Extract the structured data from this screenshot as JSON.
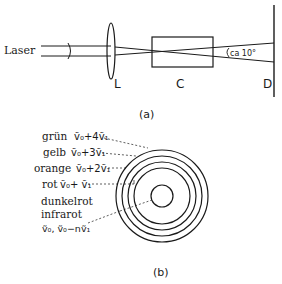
{
  "part_a": {
    "caption": "(a)",
    "laser_label": "Laser",
    "lens_label": "L",
    "cell_label": "C",
    "screen_label": "D",
    "angle_label": "ca 10°"
  },
  "part_b": {
    "caption": "(b)",
    "rings": [
      {
        "color_name": "grün",
        "formula": "ṽ₀+4ṽ₁"
      },
      {
        "color_name": "gelb",
        "formula": "ṽ₀+3ṽ₁"
      },
      {
        "color_name": "orange",
        "formula": "ṽ₀+2ṽ₁"
      },
      {
        "color_name": "rot",
        "formula": "ṽ₀+ ṽ₁"
      },
      {
        "color_name": "dunkelrot",
        "formula": ""
      },
      {
        "color_name": "infrarot",
        "formula": "ṽ₀, ṽ₀−nṽ₁"
      }
    ]
  }
}
